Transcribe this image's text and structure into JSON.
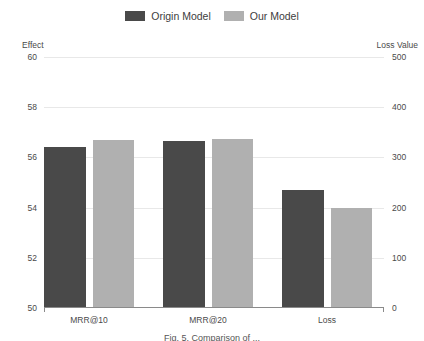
{
  "chart_data": {
    "type": "bar",
    "title": "",
    "categories": [
      "MRR@10",
      "MRR@20",
      "Loss"
    ],
    "series": [
      {
        "name": "Origin Model",
        "color": "#494949",
        "values": [
          56.4,
          56.65,
          54.7
        ],
        "axis": [
          "left",
          "left",
          "right"
        ],
        "right_axis_values": [
          null,
          null,
          237
        ]
      },
      {
        "name": "Our Model",
        "color": "#b0b0b0",
        "values": [
          56.7,
          56.75,
          54.25
        ],
        "axis": [
          "left",
          "left",
          "right"
        ],
        "right_axis_values": [
          null,
          null,
          213
        ]
      }
    ],
    "xlabel": "",
    "ylabel": "Effect",
    "y2label": "Loss Value",
    "ylim": [
      50,
      60
    ],
    "y2lim": [
      0,
      500
    ],
    "yticks": [
      "60",
      "58",
      "56",
      "54",
      "52",
      "50"
    ],
    "y2ticks": [
      "500",
      "400",
      "300",
      "200",
      "100",
      "0"
    ],
    "grid": true,
    "legend_position": "top-center"
  },
  "legend": {
    "entries": [
      {
        "label": "Origin Model",
        "color": "#494949"
      },
      {
        "label": "Our Model",
        "color": "#b0b0b0"
      }
    ]
  },
  "axes": {
    "left_title": "Effect",
    "right_title": "Loss Value",
    "left_ticks": [
      {
        "label": "60",
        "pos": 0
      },
      {
        "label": "58",
        "pos": 20
      },
      {
        "label": "56",
        "pos": 40
      },
      {
        "label": "54",
        "pos": 60
      },
      {
        "label": "52",
        "pos": 80
      },
      {
        "label": "50",
        "pos": 100
      }
    ],
    "right_ticks": [
      {
        "label": "500",
        "pos": 0
      },
      {
        "label": "400",
        "pos": 20
      },
      {
        "label": "300",
        "pos": 40
      },
      {
        "label": "200",
        "pos": 60
      },
      {
        "label": "100",
        "pos": 80
      },
      {
        "label": "0",
        "pos": 100
      }
    ],
    "x_labels": [
      "MRR@10",
      "MRR@20",
      "Loss"
    ]
  },
  "bars": [
    {
      "group": "MRR@10",
      "series": "Origin Model",
      "left_px": 0,
      "width_px": 42,
      "height_pct": 64.0
    },
    {
      "group": "MRR@10",
      "series": "Our Model",
      "left_px": 49,
      "width_px": 41,
      "height_pct": 67.0
    },
    {
      "group": "MRR@20",
      "series": "Origin Model",
      "left_px": 119,
      "width_px": 42,
      "height_pct": 66.5
    },
    {
      "group": "MRR@20",
      "series": "Our Model",
      "left_px": 168,
      "width_px": 41,
      "height_pct": 67.5
    },
    {
      "group": "Loss",
      "series": "Origin Model",
      "left_px": 238,
      "width_px": 42,
      "height_pct": 47.0
    },
    {
      "group": "Loss",
      "series": "Our Model",
      "left_px": 287,
      "width_px": 41,
      "height_pct": 40.0
    }
  ],
  "caption": {
    "text": "Fig. 5. Comparison of ..."
  }
}
